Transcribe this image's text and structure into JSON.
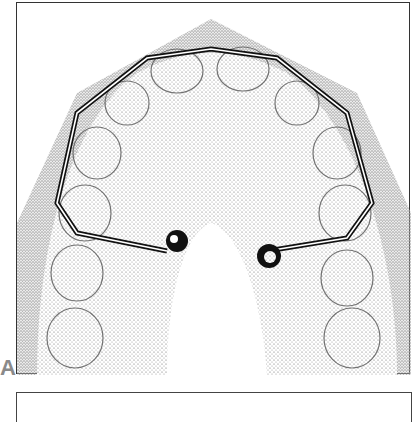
{
  "figure": {
    "panel_label": "A"
  }
}
